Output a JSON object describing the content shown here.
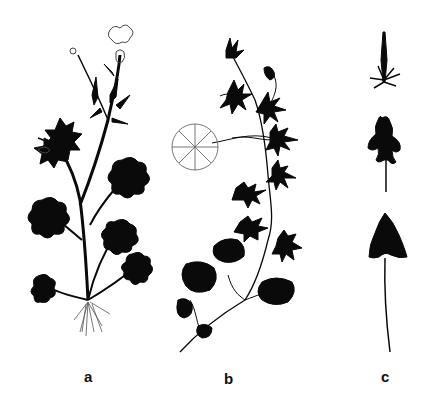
{
  "figure": {
    "panels": [
      {
        "id": "a",
        "label": "a",
        "subject": "upright plant with lobed basal leaves, narrow stem leaves, flowers and roots"
      },
      {
        "id": "b",
        "label": "b",
        "subject": "trailing stem with dissected leaves and a rounded floating leaf"
      },
      {
        "id": "c",
        "label": "c",
        "subject": "leaf series: narrow linear leaf, lobed leaf, entire deltoid long-stalked leaf"
      }
    ],
    "colors": {
      "ink": "#0a0a0a",
      "background": "#ffffff",
      "sketch": "#555555"
    }
  }
}
